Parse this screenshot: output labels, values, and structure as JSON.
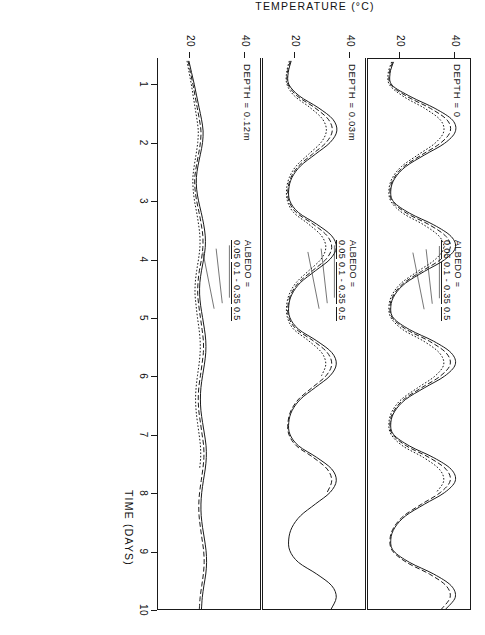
{
  "figure": {
    "orientation": "rotated-90-clockwise",
    "background": "#ffffff",
    "ink": "#1a1a1a"
  },
  "axes": {
    "y_title": "TEMPERATURE (°C)",
    "x_title": "TIME  (DAYS)",
    "y_ticks": [
      "20",
      "40"
    ],
    "y_tick_values": [
      20,
      40
    ],
    "x_ticks": [
      "1",
      "2",
      "3",
      "4",
      "5",
      "6",
      "7",
      "8",
      "9",
      "10"
    ],
    "x_tick_values": [
      1,
      2,
      3,
      4,
      5,
      6,
      7,
      8,
      9,
      10
    ]
  },
  "panels": [
    {
      "depth_label": "DEPTH = 0",
      "legend_title": "ALBEDO =",
      "legend_items": [
        "0.05",
        "0.1 - 0.35",
        "0.5"
      ]
    },
    {
      "depth_label": "DEPTH = 0.03m",
      "legend_title": "ALBEDO =",
      "legend_items": [
        "0.05",
        "0.1 - 0.35",
        "0.5"
      ]
    },
    {
      "depth_label": "DEPTH = 0.12m",
      "legend_title": "ALBEDO =",
      "legend_items": [
        "0.05",
        "0.1 - 0.35",
        "0.5"
      ]
    }
  ],
  "chart_data": {
    "type": "line",
    "title": "",
    "subtitle": "",
    "xlabel": "TIME  (DAYS)",
    "ylabel": "TEMPERATURE (°C)",
    "xlim": [
      0.55,
      10.0
    ],
    "ylim": [
      8,
      46
    ],
    "grid": false,
    "legend_position": "inside-left-of-each-panel",
    "x": [
      0.6,
      0.8,
      1.0,
      1.2,
      1.4,
      1.6,
      1.8,
      2.0,
      2.2,
      2.4,
      2.6,
      2.8,
      3.0,
      3.2,
      3.4,
      3.6,
      3.8,
      4.0,
      4.2,
      4.4,
      4.6,
      4.8,
      5.0,
      5.2,
      5.4,
      5.6,
      5.8,
      6.0,
      6.2,
      6.4,
      6.6,
      6.8,
      7.0,
      7.2,
      7.4,
      7.6,
      7.8,
      8.0,
      8.2,
      8.4,
      8.6,
      8.8,
      9.0,
      9.2,
      9.4,
      9.6,
      9.8,
      10.0
    ],
    "panels": [
      {
        "name": "DEPTH = 0",
        "series": [
          {
            "name": "0.05",
            "style": "solid",
            "values": [
              17.5,
              16.2,
              17.0,
              24.0,
              33.0,
              39.5,
              40.5,
              36.5,
              29.0,
              22.0,
              18.0,
              16.5,
              17.5,
              23.5,
              32.5,
              39.0,
              40.5,
              36.5,
              29.0,
              22.0,
              18.0,
              16.5,
              17.5,
              23.5,
              32.5,
              39.0,
              40.5,
              36.5,
              29.0,
              22.0,
              18.0,
              16.5,
              17.5,
              23.5,
              32.5,
              39.0,
              40.5,
              36.5,
              29.0,
              22.0,
              18.0,
              16.5,
              17.5,
              23.5,
              32.5,
              39.0,
              40.5,
              37.0
            ]
          },
          {
            "name": "0.1 - 0.35",
            "style": "dashed",
            "values": [
              17.2,
              15.9,
              16.6,
              22.8,
              31.3,
              37.5,
              38.6,
              34.9,
              27.9,
              21.3,
              17.6,
              16.2,
              17.1,
              22.4,
              30.9,
              37.1,
              38.6,
              34.9,
              27.9,
              21.3,
              17.6,
              16.2,
              17.1,
              22.4,
              30.9,
              37.1,
              38.6,
              34.9,
              27.9,
              21.3,
              17.6,
              16.2,
              17.1,
              22.4,
              30.9,
              37.1,
              38.6,
              34.9,
              27.9,
              21.3,
              17.6,
              16.2,
              17.1,
              22.4,
              30.9,
              37.1,
              38.6,
              35.4
            ]
          },
          {
            "name": "0.5",
            "style": "dotted",
            "values": [
              16.8,
              15.5,
              16.1,
              21.4,
              29.2,
              35.0,
              36.2,
              32.9,
              26.5,
              20.4,
              17.0,
              15.8,
              16.6,
              21.0,
              28.8,
              34.6,
              36.2,
              32.9,
              26.5,
              20.4,
              17.0,
              15.8,
              16.6,
              21.0,
              28.8,
              34.6,
              36.2,
              32.9,
              26.5,
              20.4,
              17.0,
              15.8,
              16.6,
              21.0,
              28.8,
              34.6,
              36.2,
              33.4
            ]
          }
        ]
      },
      {
        "name": "DEPTH = 0.03m",
        "series": [
          {
            "name": "0.05",
            "style": "solid",
            "values": [
              18.5,
              17.4,
              17.6,
              21.5,
              28.5,
              34.0,
              35.5,
              33.0,
              27.5,
              22.0,
              18.8,
              17.6,
              18.0,
              21.2,
              28.0,
              33.6,
              35.3,
              33.0,
              27.5,
              22.0,
              18.8,
              17.6,
              18.0,
              21.2,
              28.0,
              33.6,
              35.3,
              33.0,
              27.5,
              22.0,
              18.8,
              17.6,
              18.0,
              21.2,
              28.0,
              33.6,
              35.3,
              33.0,
              27.5,
              22.0,
              18.8,
              17.6,
              18.0,
              21.2,
              28.0,
              33.6,
              35.3,
              33.4
            ]
          },
          {
            "name": "0.1 - 0.35",
            "style": "dashed",
            "values": [
              18.2,
              17.1,
              17.3,
              20.7,
              27.2,
              32.3,
              33.8,
              31.5,
              26.4,
              21.3,
              18.4,
              17.3,
              17.6,
              20.4,
              26.7,
              31.9,
              33.6,
              31.5,
              26.4,
              21.3,
              18.4,
              17.3,
              17.6,
              20.4,
              26.7,
              31.9,
              33.6,
              31.5,
              26.4,
              21.3,
              18.4,
              17.3,
              17.6,
              20.4,
              26.7,
              31.9,
              33.6,
              31.9
            ]
          },
          {
            "name": "0.5",
            "style": "dotted",
            "values": [
              17.8,
              16.8,
              16.9,
              19.7,
              25.5,
              30.2,
              31.6,
              29.6,
              25.0,
              20.4,
              17.8,
              16.8,
              17.1,
              19.4,
              25.0,
              29.8,
              31.4,
              29.6,
              25.0,
              20.4,
              17.8,
              16.8,
              17.1,
              19.4,
              25.0,
              29.8,
              31.4,
              29.8
            ]
          }
        ]
      },
      {
        "name": "DEPTH = 0.12m",
        "series": [
          {
            "name": "0.05",
            "style": "solid",
            "values": [
              19.5,
              20.5,
              21.5,
              22.4,
              23.3,
              24.2,
              24.8,
              24.6,
              23.8,
              22.9,
              22.3,
              22.4,
              23.1,
              24.1,
              25.0,
              25.6,
              25.6,
              25.0,
              24.2,
              23.6,
              23.5,
              23.9,
              24.6,
              25.3,
              25.8,
              25.8,
              25.3,
              24.6,
              24.0,
              23.8,
              24.0,
              24.6,
              25.3,
              25.9,
              26.0,
              25.6,
              24.9,
              24.3,
              24.0,
              24.1,
              24.6,
              25.3,
              25.9,
              26.1,
              25.8,
              25.1,
              24.5,
              24.2
            ]
          },
          {
            "name": "0.1 - 0.35",
            "style": "dashed",
            "values": [
              19.2,
              20.1,
              21.0,
              21.8,
              22.6,
              23.4,
              24.0,
              23.8,
              23.1,
              22.3,
              21.7,
              21.8,
              22.4,
              23.3,
              24.1,
              24.7,
              24.7,
              24.2,
              23.4,
              22.9,
              22.8,
              23.2,
              23.8,
              24.4,
              24.9,
              24.9,
              24.4,
              23.8,
              23.2,
              23.0,
              23.2,
              23.8,
              24.4,
              25.0,
              25.1,
              24.7,
              24.1,
              23.5,
              23.2,
              23.3,
              23.8,
              24.4,
              25.0,
              25.2,
              24.9,
              24.3,
              23.7,
              23.4
            ]
          },
          {
            "name": "0.5",
            "style": "dotted",
            "values": [
              18.8,
              19.6,
              20.4,
              21.1,
              21.8,
              22.5,
              23.0,
              22.8,
              22.2,
              21.5,
              21.0,
              21.1,
              21.6,
              22.4,
              23.1,
              23.6,
              23.6,
              23.1,
              22.4,
              21.9,
              21.8,
              22.2,
              22.7,
              23.3,
              23.7,
              23.7,
              23.3,
              22.7,
              22.2,
              22.0,
              22.2,
              22.7,
              23.3,
              23.8,
              23.9,
              23.5
            ]
          }
        ]
      }
    ]
  }
}
